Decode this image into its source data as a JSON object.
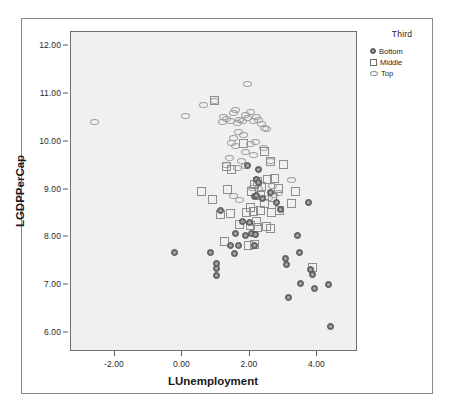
{
  "chart_data": {
    "type": "scatter",
    "title": "",
    "xlabel": "LUnemployment",
    "ylabel": "LGDPPerCap",
    "xlim": [
      -3.3,
      5.2
    ],
    "ylim": [
      5.6,
      12.3
    ],
    "xticks": [
      "-2.00",
      "0.00",
      "2.00",
      "4.00"
    ],
    "xtick_values": [
      -2,
      0,
      2,
      4
    ],
    "yticks": [
      "6.00",
      "7.00",
      "8.00",
      "9.00",
      "10.00",
      "11.00",
      "12.00"
    ],
    "ytick_values": [
      6,
      7,
      8,
      9,
      10,
      11,
      12
    ],
    "grid": false,
    "legend": {
      "title": "Third",
      "position": "right",
      "entries": [
        {
          "label": "Bottom",
          "marker": "filled-circle"
        },
        {
          "label": "Middle",
          "marker": "open-square"
        },
        {
          "label": "Top",
          "marker": "open-ellipse"
        }
      ]
    },
    "series": [
      {
        "name": "Top",
        "marker": "open-ellipse",
        "color": "#9d9d9d",
        "points": [
          [
            -2.6,
            10.42
          ],
          [
            0.1,
            10.55
          ],
          [
            0.62,
            10.78
          ],
          [
            0.96,
            10.86
          ],
          [
            1.22,
            10.52
          ],
          [
            1.3,
            10.48
          ],
          [
            1.42,
            10.44
          ],
          [
            1.5,
            10.6
          ],
          [
            1.58,
            10.66
          ],
          [
            1.62,
            10.4
          ],
          [
            1.7,
            10.46
          ],
          [
            1.78,
            10.44
          ],
          [
            1.86,
            10.56
          ],
          [
            1.94,
            10.5
          ],
          [
            2.02,
            10.62
          ],
          [
            2.1,
            10.44
          ],
          [
            2.18,
            10.52
          ],
          [
            2.26,
            10.46
          ],
          [
            2.34,
            10.38
          ],
          [
            2.42,
            10.3
          ],
          [
            2.48,
            10.26
          ],
          [
            1.66,
            10.2
          ],
          [
            1.8,
            10.14
          ],
          [
            1.5,
            10.08
          ],
          [
            1.44,
            9.98
          ],
          [
            1.58,
            9.92
          ],
          [
            2.02,
            9.96
          ],
          [
            2.16,
            10.0
          ],
          [
            1.88,
            9.78
          ],
          [
            2.1,
            9.72
          ],
          [
            1.74,
            9.6
          ],
          [
            1.38,
            9.66
          ],
          [
            1.3,
            9.52
          ],
          [
            1.62,
            9.46
          ],
          [
            1.86,
            9.5
          ],
          [
            2.4,
            9.88
          ],
          [
            2.62,
            9.6
          ],
          [
            1.94,
            11.22
          ],
          [
            3.24,
            9.2
          ],
          [
            2.66,
            9.08
          ],
          [
            2.08,
            9.04
          ],
          [
            2.26,
            9.02
          ],
          [
            1.52,
            8.86
          ],
          [
            2.54,
            8.82
          ],
          [
            2.7,
            8.88
          ],
          [
            2.86,
            8.92
          ],
          [
            1.68,
            8.78
          ],
          [
            1.2,
            10.42
          ]
        ]
      },
      {
        "name": "Middle",
        "marker": "open-square",
        "color": "#8e8e8e",
        "points": [
          [
            0.96,
            10.86
          ],
          [
            0.56,
            8.96
          ],
          [
            0.88,
            8.8
          ],
          [
            1.3,
            9.48
          ],
          [
            1.44,
            9.42
          ],
          [
            1.8,
            9.96
          ],
          [
            2.44,
            9.8
          ],
          [
            2.62,
            9.58
          ],
          [
            2.98,
            9.52
          ],
          [
            3.34,
            8.96
          ],
          [
            3.22,
            8.7
          ],
          [
            2.88,
            8.56
          ],
          [
            2.64,
            8.52
          ],
          [
            2.3,
            8.56
          ],
          [
            2.1,
            8.54
          ],
          [
            1.9,
            8.52
          ],
          [
            1.42,
            8.5
          ],
          [
            1.12,
            8.48
          ],
          [
            1.26,
            7.92
          ],
          [
            1.7,
            8.28
          ],
          [
            2.02,
            8.24
          ],
          [
            2.22,
            8.2
          ],
          [
            2.48,
            8.22
          ],
          [
            2.62,
            8.18
          ],
          [
            2.14,
            9.1
          ],
          [
            2.22,
            9.16
          ],
          [
            2.34,
            9.06
          ],
          [
            2.06,
            8.96
          ],
          [
            2.3,
            8.88
          ],
          [
            2.66,
            8.84
          ],
          [
            2.86,
            9.02
          ],
          [
            2.18,
            8.34
          ],
          [
            1.96,
            7.84
          ],
          [
            2.14,
            7.86
          ],
          [
            3.84,
            7.36
          ],
          [
            2.52,
            9.22
          ],
          [
            2.74,
            9.24
          ],
          [
            1.34,
            9.0
          ],
          [
            2.42,
            8.7
          ],
          [
            2.02,
            8.62
          ]
        ]
      },
      {
        "name": "Bottom",
        "marker": "filled-circle",
        "color": "#6e6e6e",
        "points": [
          [
            -0.22,
            7.68
          ],
          [
            0.84,
            7.68
          ],
          [
            1.0,
            7.46
          ],
          [
            1.02,
            7.34
          ],
          [
            1.0,
            7.2
          ],
          [
            1.12,
            8.56
          ],
          [
            1.56,
            8.08
          ],
          [
            1.66,
            7.82
          ],
          [
            1.54,
            7.66
          ],
          [
            1.86,
            8.04
          ],
          [
            2.06,
            8.08
          ],
          [
            2.12,
            7.82
          ],
          [
            1.78,
            8.34
          ],
          [
            2.0,
            8.32
          ],
          [
            1.94,
            9.5
          ],
          [
            2.24,
            9.42
          ],
          [
            2.2,
            9.22
          ],
          [
            2.26,
            9.14
          ],
          [
            2.12,
            8.86
          ],
          [
            2.18,
            8.88
          ],
          [
            2.38,
            8.82
          ],
          [
            2.62,
            8.94
          ],
          [
            2.8,
            8.74
          ],
          [
            3.06,
            7.56
          ],
          [
            3.08,
            7.44
          ],
          [
            3.42,
            8.04
          ],
          [
            3.48,
            7.68
          ],
          [
            3.5,
            7.04
          ],
          [
            3.8,
            7.32
          ],
          [
            3.86,
            7.22
          ],
          [
            3.9,
            6.94
          ],
          [
            3.14,
            6.74
          ],
          [
            4.34,
            7.02
          ],
          [
            4.4,
            6.14
          ],
          [
            3.74,
            8.72
          ],
          [
            2.9,
            8.58
          ],
          [
            2.16,
            8.06
          ],
          [
            1.42,
            7.84
          ]
        ]
      }
    ]
  }
}
